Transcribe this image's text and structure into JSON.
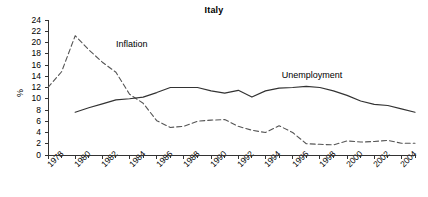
{
  "chart_data": {
    "type": "line",
    "title": "Italy",
    "xlabel": "",
    "ylabel": "%",
    "xlim": [
      1978,
      2005
    ],
    "ylim": [
      0,
      24
    ],
    "ytick_step": 2,
    "yticks": [
      0,
      2,
      4,
      6,
      8,
      10,
      12,
      14,
      16,
      18,
      20,
      22,
      24
    ],
    "xticks": [
      1978,
      1980,
      1982,
      1984,
      1986,
      1988,
      1990,
      1992,
      1994,
      1996,
      1998,
      2000,
      2002,
      2004
    ],
    "xtick_labels": [
      "1978",
      "1980",
      "1982",
      "1984",
      "1986",
      "1988",
      "1990",
      "1992",
      "1994",
      "1996",
      "1998",
      "2000",
      "2002",
      "2004"
    ],
    "xtick_minor_step": 1,
    "grid": false,
    "legend_position": "inline-annotation",
    "axis_color": "#333333",
    "series": [
      {
        "name": "Inflation",
        "style": "dashed",
        "color": "#555555",
        "label_x": 1983.0,
        "label_y": 19.6,
        "x": [
          1978,
          1979,
          1980,
          1981,
          1982,
          1983,
          1984,
          1985,
          1986,
          1987,
          1988,
          1989,
          1990,
          1991,
          1992,
          1993,
          1994,
          1995,
          1996,
          1997,
          1998,
          1999,
          2000,
          2001,
          2002,
          2003,
          2004,
          2005
        ],
        "values": [
          12.0,
          14.8,
          21.2,
          18.7,
          16.5,
          14.7,
          10.8,
          9.2,
          6.1,
          4.9,
          5.1,
          6.0,
          6.2,
          6.3,
          5.1,
          4.4,
          4.0,
          5.2,
          4.0,
          2.0,
          1.9,
          1.8,
          2.5,
          2.3,
          2.4,
          2.6,
          2.1,
          2.1
        ]
      },
      {
        "name": "Unemployment",
        "style": "solid",
        "color": "#333333",
        "label_x": 1995.2,
        "label_y": 14.1,
        "x": [
          1980,
          1981,
          1982,
          1983,
          1984,
          1985,
          1986,
          1987,
          1988,
          1989,
          1990,
          1991,
          1992,
          1993,
          1994,
          1995,
          1996,
          1997,
          1998,
          1999,
          2000,
          2001,
          2002,
          2003,
          2004,
          2005
        ],
        "values": [
          7.6,
          8.4,
          9.1,
          9.8,
          10.0,
          10.3,
          11.1,
          12.0,
          12.0,
          12.0,
          11.4,
          11.0,
          11.5,
          10.3,
          11.4,
          11.9,
          12.0,
          12.2,
          12.0,
          11.4,
          10.6,
          9.6,
          9.0,
          8.8,
          8.2,
          7.6
        ]
      }
    ]
  }
}
